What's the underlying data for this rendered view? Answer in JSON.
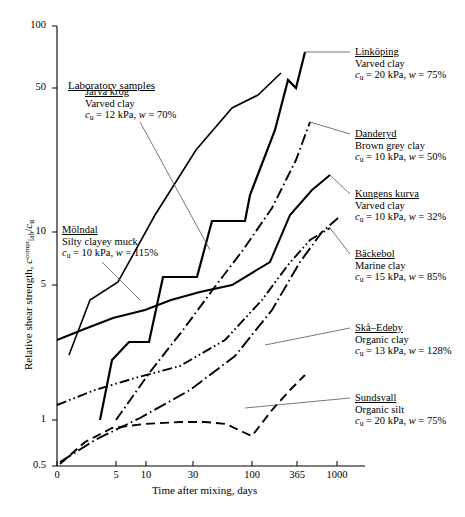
{
  "chart_data": {
    "type": "line",
    "title": "",
    "xlabel": "Time after mixing, days",
    "ylabel": "Relative shear strength, c_lab^compr / c_u",
    "ylabel_parts": {
      "prefix": "Relative shear strength, ",
      "sym": "c",
      "sub": "lab",
      "sup": "compr",
      "div": "/",
      "sym2": "c",
      "sub2": "u"
    },
    "xticks": [
      "0",
      "5",
      "10",
      "30",
      "100",
      "365",
      "1000"
    ],
    "xtick_px": [
      57,
      116,
      146,
      193,
      252,
      297,
      337
    ],
    "yticks": [
      "100",
      "50",
      "10",
      "5",
      "1",
      "0.5"
    ],
    "ytick_values": [
      100,
      50,
      10,
      5,
      1,
      0.5
    ],
    "ytick_px": [
      26,
      88,
      232,
      285,
      420,
      466
    ],
    "xscale": "log-after-zero",
    "yscale": "log",
    "ylim": [
      0.5,
      100
    ],
    "grid": false,
    "legend_position": "inline-annotations",
    "group_heading": "Laboratory samples",
    "series": [
      {
        "name": "Linköping",
        "soil": "Varved clay",
        "cu": "20 kPa",
        "w": "75%",
        "props": "c_u = 20 kPa, w = 75%",
        "style": "solid-thick",
        "points_px": [
          [
            100,
            420
          ],
          [
            112,
            360
          ],
          [
            129,
            342
          ],
          [
            149,
            342
          ],
          [
            163,
            277
          ],
          [
            197,
            277
          ],
          [
            212,
            221
          ],
          [
            245,
            221
          ],
          [
            250,
            195
          ],
          [
            275,
            130
          ],
          [
            288,
            80
          ],
          [
            296,
            88
          ],
          [
            305,
            52
          ]
        ]
      },
      {
        "name": "Järva krog",
        "soil": "Varved clay",
        "cu": "12 kPa",
        "w": "70%",
        "props": "c_u = 12 kPa, w = 70%",
        "style": "solid-thin-steep",
        "points_px": [
          [
            69,
            355
          ],
          [
            90,
            300
          ],
          [
            118,
            282
          ],
          [
            155,
            215
          ],
          [
            196,
            150
          ],
          [
            232,
            108
          ],
          [
            258,
            95
          ],
          [
            281,
            73
          ]
        ]
      },
      {
        "name": "Danderyd",
        "soil": "Brown grey clay",
        "cu": "10 kPa",
        "w": "50%",
        "props": "c_u = 10 kPa, w = 50%",
        "style": "dash-dot",
        "points_px": [
          [
            116,
            420
          ],
          [
            150,
            372
          ],
          [
            183,
            330
          ],
          [
            214,
            288
          ],
          [
            243,
            250
          ],
          [
            272,
            208
          ],
          [
            296,
            160
          ],
          [
            310,
            122
          ]
        ]
      },
      {
        "name": "Kungens kurva",
        "soil": "Varved clay",
        "cu": "10 kPa",
        "w": "32%",
        "props": "c_u = 10 kPa, w = 32%",
        "style": "solid-thick-2",
        "points_px": [
          [
            57,
            340
          ],
          [
            82,
            330
          ],
          [
            113,
            318
          ],
          [
            145,
            310
          ],
          [
            171,
            300
          ],
          [
            200,
            292
          ],
          [
            232,
            285
          ],
          [
            270,
            262
          ],
          [
            290,
            215
          ],
          [
            312,
            190
          ],
          [
            330,
            175
          ]
        ]
      },
      {
        "name": "Bäckebol",
        "soil": "Marine clay",
        "cu": "15 kPa",
        "w": "85%",
        "props": "c_u = 15 kPa, w = 85%",
        "style": "dash-dot-dot",
        "points_px": [
          [
            57,
            405
          ],
          [
            95,
            390
          ],
          [
            135,
            378
          ],
          [
            180,
            366
          ],
          [
            225,
            340
          ],
          [
            262,
            300
          ],
          [
            288,
            265
          ],
          [
            310,
            240
          ],
          [
            330,
            228
          ]
        ]
      },
      {
        "name": "Skå–Edeby",
        "soil": "Organic clay",
        "cu": "13 kPa",
        "w": "128%",
        "props": "c_u = 13 kPa, w = 128%",
        "style": "dash-dot-long",
        "points_px": [
          [
            60,
            462
          ],
          [
            95,
            440
          ],
          [
            140,
            418
          ],
          [
            190,
            390
          ],
          [
            235,
            356
          ],
          [
            272,
            310
          ],
          [
            300,
            262
          ],
          [
            322,
            232
          ],
          [
            338,
            218
          ]
        ]
      },
      {
        "name": "Sundsvall",
        "soil": "Organic silt",
        "cu": "20 kPa",
        "w": "75%",
        "props": "c_u = 20 kPa, w = 75%",
        "style": "dashed",
        "points_px": [
          [
            60,
            464
          ],
          [
            85,
            442
          ],
          [
            112,
            428
          ],
          [
            144,
            424
          ],
          [
            180,
            422
          ],
          [
            205,
            422
          ],
          [
            226,
            424
          ],
          [
            243,
            432
          ],
          [
            252,
            436
          ],
          [
            272,
            410
          ],
          [
            290,
            390
          ],
          [
            305,
            375
          ]
        ]
      }
    ],
    "annotations": [
      {
        "id": "linkoping",
        "x": 355,
        "y": 46,
        "leader": [
          [
            305,
            52
          ],
          [
            350,
            52
          ]
        ]
      },
      {
        "id": "danderyd",
        "x": 355,
        "y": 128,
        "leader": [
          [
            310,
            122
          ],
          [
            350,
            134
          ]
        ]
      },
      {
        "id": "kungens",
        "x": 355,
        "y": 188,
        "leader": [
          [
            330,
            175
          ],
          [
            350,
            194
          ]
        ]
      },
      {
        "id": "backebol",
        "x": 355,
        "y": 248,
        "leader": [
          [
            330,
            228
          ],
          [
            350,
            254
          ]
        ]
      },
      {
        "id": "ska",
        "x": 355,
        "y": 322,
        "leader": [
          [
            265,
            345
          ],
          [
            350,
            328
          ]
        ]
      },
      {
        "id": "sundsvall",
        "x": 355,
        "y": 392,
        "leader": [
          [
            245,
            408
          ],
          [
            350,
            398
          ]
        ]
      },
      {
        "id": "jarva",
        "x": 85,
        "y": 86,
        "leader": [
          [
            140,
            122
          ],
          [
            210,
            250
          ]
        ]
      },
      {
        "id": "molndal",
        "x": 62,
        "y": 228,
        "leader": [
          [
            102,
            262
          ],
          [
            140,
            300
          ]
        ]
      }
    ]
  },
  "samples": {
    "heading": "Laboratory samples",
    "molndal": {
      "name": "Mölndal",
      "soil": "Silty clayey muck",
      "cu": "10 kPa",
      "w": "115%"
    }
  }
}
